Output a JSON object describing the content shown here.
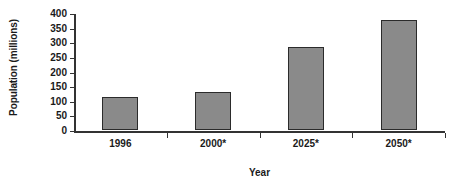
{
  "chart_data": {
    "type": "bar",
    "title": "",
    "xlabel": "Year",
    "ylabel": "Population (millions)",
    "categories": [
      "1996",
      "2000*",
      "2025*",
      "2050*"
    ],
    "values": [
      113,
      130,
      284,
      376
    ],
    "ylim": [
      0,
      400
    ],
    "y_ticks": [
      "0",
      "50",
      "100",
      "150",
      "200",
      "250",
      "300",
      "350",
      "400"
    ],
    "y_tick_values": [
      0,
      50,
      100,
      150,
      200,
      250,
      300,
      350,
      400
    ],
    "grid": false,
    "legend": null,
    "bar_color": "#8a8a8a",
    "bar_border_color": "#2b2b2b",
    "axis_color": "#333333",
    "background_color": "#ffffff",
    "note": "* indicates projected values"
  }
}
